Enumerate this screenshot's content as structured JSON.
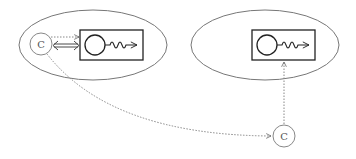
{
  "diagram": {
    "colors": {
      "ellipse_stroke": "#777777",
      "box_stroke": "#222222",
      "circle_stroke": "#888888",
      "dotted_stroke": "#888888",
      "solid_arrow": "#333333"
    },
    "left_group": {
      "component_label": "C"
    },
    "remote_component": {
      "label": "C"
    }
  }
}
